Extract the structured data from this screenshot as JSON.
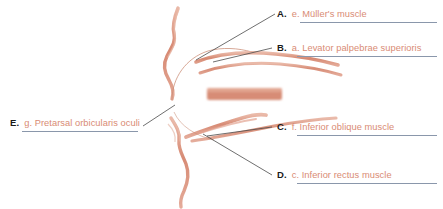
{
  "figure": {
    "palette": {
      "stroke_salmon": "#d98b74",
      "stroke_salmon_light": "#e3a892",
      "stroke_salmon_deep": "#c97a62",
      "label_text": "#d98b74",
      "letter_text": "#1a1a1a",
      "rule_line": "#8a97ab",
      "leader_line": "#4a4a4a",
      "background": "#ffffff"
    }
  },
  "labels": [
    {
      "letter": "A.",
      "name": "e. Müller's muscle",
      "side": "right",
      "x": 277,
      "y": 8,
      "rule_x": 300,
      "rule_y": 22,
      "rule_w": 137
    },
    {
      "letter": "B.",
      "name": "a. Levator palpebrae superioris",
      "side": "right",
      "x": 277,
      "y": 42,
      "rule_x": 297,
      "rule_y": 56,
      "rule_w": 140
    },
    {
      "letter": "C.",
      "name": "f. Inferior oblique muscle",
      "side": "right",
      "x": 277,
      "y": 121,
      "rule_x": 297,
      "rule_y": 135,
      "rule_w": 140
    },
    {
      "letter": "D.",
      "name": "c. Inferior rectus muscle",
      "side": "right",
      "x": 277,
      "y": 169,
      "rule_x": 297,
      "rule_y": 183,
      "rule_w": 140
    },
    {
      "letter": "E.",
      "name": "g. Pretarsal orbicularis oculi",
      "side": "left",
      "x": 10,
      "y": 117,
      "rule_x": 22,
      "rule_y": 131,
      "rule_w": 116
    }
  ]
}
